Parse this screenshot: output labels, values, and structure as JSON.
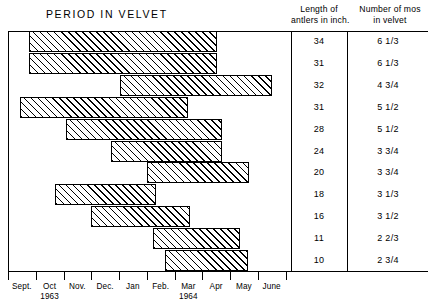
{
  "chart_title": "PERIOD IN VELVET",
  "columns": {
    "antler_length": {
      "line1": "Length of",
      "line2": "antlers in inch."
    },
    "months_velvet": {
      "line1": "Number of mos",
      "line2": "in velvet"
    }
  },
  "axis": {
    "ticks": [
      "Sept.",
      "Oct",
      "Nov.",
      "Dec.",
      "Jan",
      "Feb.",
      "Mar",
      "Apr",
      "May",
      "June"
    ],
    "year_left": "1963",
    "year_right": "1964",
    "year_left_tick_index": 1,
    "year_right_tick_index": 6
  },
  "chart_data": {
    "type": "bar",
    "subtype": "horizontal-range-bar",
    "title": "PERIOD IN VELVET",
    "xlabel": "",
    "ylabel": "",
    "grid": false,
    "legend": null,
    "x_tick_labels": [
      "Sept.",
      "Oct",
      "Nov.",
      "Dec.",
      "Jan",
      "Feb.",
      "Mar",
      "Apr",
      "May",
      "June"
    ],
    "x_axis_note": "Months Sept 1963 through June 1964",
    "categories": [
      "34",
      "31",
      "32",
      "31",
      "28",
      "24",
      "20",
      "18",
      "16",
      "11",
      "10"
    ],
    "rows": [
      {
        "antler_length_in": "34",
        "months_in_velvet": "6 1/3",
        "start_month": "Oct",
        "end_month": "Apr",
        "start_units": 0.75,
        "end_units": 7.55
      },
      {
        "antler_length_in": "31",
        "months_in_velvet": "6 1/3",
        "start_month": "Oct",
        "end_month": "Apr",
        "start_units": 0.75,
        "end_units": 7.55
      },
      {
        "antler_length_in": "32",
        "months_in_velvet": "4 3/4",
        "start_month": "Jan",
        "end_month": "May",
        "start_units": 4.05,
        "end_units": 9.52
      },
      {
        "antler_length_in": "31",
        "months_in_velvet": "5 1/2",
        "start_month": "Sept",
        "end_month": "Feb.",
        "start_units": 0.45,
        "end_units": 6.5
      },
      {
        "antler_length_in": "28",
        "months_in_velvet": "5 1/2",
        "start_month": "Nov.",
        "end_month": "Apr",
        "start_units": 2.1,
        "end_units": 7.7
      },
      {
        "antler_length_in": "24",
        "months_in_velvet": "3 3/4",
        "start_month": "Dec.",
        "end_month": "Apr",
        "start_units": 3.7,
        "end_units": 7.7
      },
      {
        "antler_length_in": "20",
        "months_in_velvet": "3 3/4",
        "start_month": "Jan",
        "end_month": "May",
        "start_units": 5.0,
        "end_units": 8.7
      },
      {
        "antler_length_in": "18",
        "months_in_velvet": "3 1/3",
        "start_month": "Oct",
        "end_month": "Feb.",
        "start_units": 1.7,
        "end_units": 5.32
      },
      {
        "antler_length_in": "16",
        "months_in_velvet": "3 1/2",
        "start_month": "Nov.",
        "end_month": "Mar",
        "start_units": 3.0,
        "end_units": 6.55
      },
      {
        "antler_length_in": "11",
        "months_in_velvet": "2 2/3",
        "start_month": "Feb.",
        "end_month": "May",
        "start_units": 5.22,
        "end_units": 8.35
      },
      {
        "antler_length_in": "10",
        "months_in_velvet": "2 3/4",
        "start_month": "Feb.",
        "end_month": "May",
        "start_units": 5.65,
        "end_units": 8.65
      }
    ]
  }
}
